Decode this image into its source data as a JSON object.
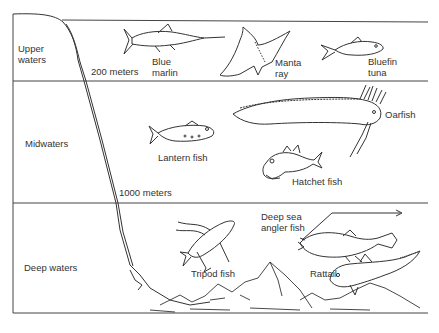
{
  "zones": [
    {
      "label": "Upper\nwaters"
    },
    {
      "label": "Midwaters"
    },
    {
      "label": "Deep waters"
    }
  ],
  "depth_markers": [
    {
      "label": "200 meters"
    },
    {
      "label": "1000 meters"
    }
  ],
  "organisms": [
    {
      "label": "Blue\nmarlin",
      "zone": "Upper waters"
    },
    {
      "label": "Manta\nray",
      "zone": "Upper waters"
    },
    {
      "label": "Bluefin\ntuna",
      "zone": "Upper waters"
    },
    {
      "label": "Oarfish",
      "zone": "Midwaters"
    },
    {
      "label": "Lantern fish",
      "zone": "Midwaters"
    },
    {
      "label": "Hatchet fish",
      "zone": "Midwaters"
    },
    {
      "label": "Deep sea\nangler fish",
      "zone": "Deep waters"
    },
    {
      "label": "Tripod fish",
      "zone": "Deep waters"
    },
    {
      "label": "Rattail",
      "zone": "Deep waters"
    }
  ],
  "colors": {
    "line": "#3a3a3a",
    "background": "#ffffff"
  }
}
